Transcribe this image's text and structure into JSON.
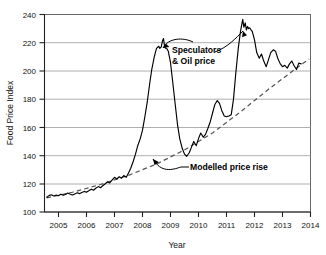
{
  "chart_data": {
    "type": "line",
    "title": "",
    "xlabel": "Year",
    "ylabel": "Food Price Index",
    "xlim": [
      2004.5,
      2014.0
    ],
    "ylim": [
      100,
      240
    ],
    "ytick_values": [
      100,
      120,
      140,
      160,
      180,
      200,
      220,
      240
    ],
    "ytick_labels": [
      "100",
      "120",
      "140",
      "160",
      "180",
      "200",
      "220",
      "240"
    ],
    "xtick_values": [
      2005,
      2006,
      2007,
      2008,
      2009,
      2010,
      2011,
      2012,
      2013,
      2014
    ],
    "xtick_labels": [
      "2005",
      "2006",
      "2007",
      "2008",
      "2009",
      "2010",
      "2011",
      "2012",
      "2013",
      "2014"
    ],
    "grid": "horizontal",
    "legend": "none",
    "series": [
      {
        "name": "Food Price Index",
        "style": "solid",
        "color": "#000000",
        "points": [
          [
            2004.58,
            110.5
          ],
          [
            2004.67,
            111.8
          ],
          [
            2004.75,
            112.2
          ],
          [
            2004.83,
            111.4
          ],
          [
            2004.92,
            112.0
          ],
          [
            2005.0,
            111.5
          ],
          [
            2005.08,
            112.6
          ],
          [
            2005.17,
            111.9
          ],
          [
            2005.25,
            112.4
          ],
          [
            2005.33,
            113.4
          ],
          [
            2005.42,
            112.6
          ],
          [
            2005.5,
            112.0
          ],
          [
            2005.58,
            112.8
          ],
          [
            2005.67,
            113.6
          ],
          [
            2005.75,
            113.0
          ],
          [
            2005.83,
            113.8
          ],
          [
            2005.92,
            114.6
          ],
          [
            2006.0,
            114.0
          ],
          [
            2006.08,
            115.0
          ],
          [
            2006.17,
            116.2
          ],
          [
            2006.25,
            115.4
          ],
          [
            2006.33,
            116.8
          ],
          [
            2006.42,
            118.0
          ],
          [
            2006.5,
            117.2
          ],
          [
            2006.58,
            118.6
          ],
          [
            2006.67,
            120.0
          ],
          [
            2006.75,
            121.4
          ],
          [
            2006.83,
            120.6
          ],
          [
            2006.92,
            122.8
          ],
          [
            2007.0,
            124.6
          ],
          [
            2007.08,
            123.4
          ],
          [
            2007.17,
            125.0
          ],
          [
            2007.25,
            124.0
          ],
          [
            2007.33,
            125.8
          ],
          [
            2007.42,
            124.6
          ],
          [
            2007.5,
            127.6
          ],
          [
            2007.58,
            131.0
          ],
          [
            2007.67,
            136.0
          ],
          [
            2007.75,
            141.0
          ],
          [
            2007.83,
            147.0
          ],
          [
            2007.92,
            152.0
          ],
          [
            2008.0,
            158.0
          ],
          [
            2008.08,
            167.0
          ],
          [
            2008.17,
            178.0
          ],
          [
            2008.25,
            190.0
          ],
          [
            2008.33,
            201.0
          ],
          [
            2008.42,
            210.0
          ],
          [
            2008.5,
            216.0
          ],
          [
            2008.58,
            217.5
          ],
          [
            2008.62,
            216.0
          ],
          [
            2008.67,
            217.0
          ],
          [
            2008.71,
            221.0
          ],
          [
            2008.75,
            223.0
          ],
          [
            2008.79,
            217.0
          ],
          [
            2008.83,
            216.0
          ],
          [
            2008.88,
            215.5
          ],
          [
            2008.92,
            214.0
          ],
          [
            2009.0,
            206.0
          ],
          [
            2009.08,
            192.0
          ],
          [
            2009.17,
            176.0
          ],
          [
            2009.25,
            162.0
          ],
          [
            2009.33,
            152.0
          ],
          [
            2009.42,
            145.0
          ],
          [
            2009.5,
            141.0
          ],
          [
            2009.58,
            139.5
          ],
          [
            2009.67,
            142.0
          ],
          [
            2009.75,
            146.0
          ],
          [
            2009.83,
            150.0
          ],
          [
            2009.92,
            147.0
          ],
          [
            2010.0,
            152.0
          ],
          [
            2010.08,
            156.0
          ],
          [
            2010.17,
            153.0
          ],
          [
            2010.25,
            155.0
          ],
          [
            2010.33,
            159.0
          ],
          [
            2010.42,
            164.0
          ],
          [
            2010.5,
            170.0
          ],
          [
            2010.58,
            176.0
          ],
          [
            2010.67,
            179.0
          ],
          [
            2010.75,
            177.0
          ],
          [
            2010.83,
            172.0
          ],
          [
            2010.92,
            168.0
          ],
          [
            2011.0,
            167.5
          ],
          [
            2011.08,
            168.0
          ],
          [
            2011.17,
            169.0
          ],
          [
            2011.25,
            180.0
          ],
          [
            2011.33,
            198.0
          ],
          [
            2011.42,
            216.0
          ],
          [
            2011.5,
            228.0
          ],
          [
            2011.58,
            236.5
          ],
          [
            2011.62,
            231.0
          ],
          [
            2011.67,
            234.0
          ],
          [
            2011.71,
            229.0
          ],
          [
            2011.75,
            231.5
          ],
          [
            2011.79,
            230.0
          ],
          [
            2011.83,
            230.5
          ],
          [
            2011.88,
            229.0
          ],
          [
            2011.92,
            228.0
          ],
          [
            2012.0,
            222.0
          ],
          [
            2012.08,
            213.0
          ],
          [
            2012.17,
            209.0
          ],
          [
            2012.25,
            212.0
          ],
          [
            2012.33,
            207.0
          ],
          [
            2012.42,
            203.0
          ],
          [
            2012.5,
            208.0
          ],
          [
            2012.58,
            213.0
          ],
          [
            2012.67,
            215.0
          ],
          [
            2012.75,
            214.0
          ],
          [
            2012.83,
            209.0
          ],
          [
            2012.92,
            205.0
          ],
          [
            2013.0,
            203.0
          ],
          [
            2013.08,
            204.0
          ],
          [
            2013.17,
            202.0
          ],
          [
            2013.25,
            205.0
          ],
          [
            2013.33,
            207.0
          ],
          [
            2013.42,
            203.5
          ],
          [
            2013.5,
            201.0
          ],
          [
            2013.58,
            205.5
          ],
          [
            2013.67,
            205.0
          ]
        ]
      },
      {
        "name": "Modelled price rise",
        "style": "dashed",
        "color": "#555555",
        "points": [
          [
            2004.58,
            110.0
          ],
          [
            2005.5,
            114.0
          ],
          [
            2006.5,
            119.5
          ],
          [
            2007.5,
            126.0
          ],
          [
            2008.5,
            134.0
          ],
          [
            2009.5,
            144.0
          ],
          [
            2010.5,
            156.0
          ],
          [
            2011.5,
            171.0
          ],
          [
            2012.5,
            187.0
          ],
          [
            2013.5,
            202.0
          ],
          [
            2013.95,
            208.5
          ]
        ]
      }
    ],
    "annotations": [
      {
        "id": "speculators",
        "text_line1": "Speculators",
        "text_line2": "& Oil price",
        "targets": [
          "2008.55 peak",
          "2011.45 rise"
        ]
      },
      {
        "id": "modelled",
        "text": "Modelled price rise",
        "targets": [
          "dashed trend line near 2008.7"
        ]
      }
    ]
  },
  "colors": {
    "axis": "#222222",
    "grid": "#9a9a9a",
    "series_primary": "#000000",
    "series_model": "#555555",
    "background": "#ffffff"
  }
}
